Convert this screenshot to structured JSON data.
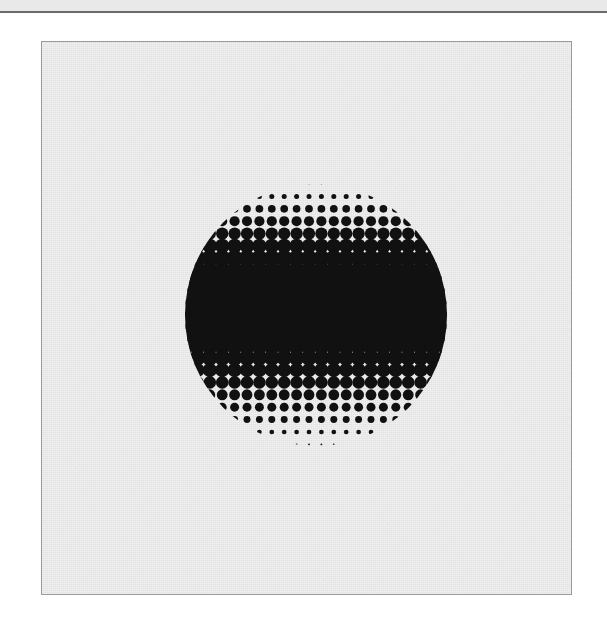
{
  "canvas": {
    "width": 607,
    "height": 635,
    "background_color": "#ffffff"
  },
  "top_band": {
    "name": "decorative-band",
    "height": 11,
    "color": "#e9e9e9"
  },
  "top_rule": {
    "name": "horizontal-rule",
    "y": 11,
    "thickness": 2,
    "color": "#6b6b6b"
  },
  "panel": {
    "x": 41,
    "y": 41,
    "width": 531,
    "height": 554,
    "background_color": "#e8e8e8",
    "border_color": "#9a9a9a",
    "border_width": 1
  },
  "artwork": {
    "title": "Halftone Gradient Circle",
    "type": "halftone-dot-raster",
    "ink_color": "#111111",
    "paper_color": "#e8e8e8",
    "circle": {
      "center_x": 315,
      "center_y": 314,
      "diameter": 262,
      "radius": 131
    },
    "lattice": {
      "type": "square-grid",
      "pitch": 12.4,
      "rotation_degrees": 0
    },
    "gradient": {
      "axis": "vertical",
      "description": "dot radius grows from the circle's top and bottom edges toward a solid black horizontal band across the middle",
      "band_top_y": 264,
      "band_bottom_y": 344,
      "min_dot_radius": 0.6,
      "max_dot_radius": 8.8,
      "solid_overlap": true
    }
  }
}
